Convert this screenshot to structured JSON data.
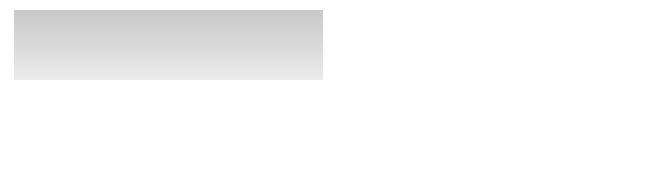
{
  "diagram": {
    "type": "communication-process-model",
    "nodes": [
      {
        "id": "source",
        "label": "Source"
      },
      {
        "id": "message",
        "label": "Message"
      },
      {
        "id": "medium",
        "label": "Medium"
      },
      {
        "id": "receiver",
        "label": "Receiver"
      },
      {
        "id": "feedback",
        "label": "Feedback"
      }
    ],
    "stages": [
      {
        "id": "encoding",
        "label": "Encoding",
        "fill": "#ececec"
      },
      {
        "id": "transmission",
        "label": "Transmission",
        "fill": "#9a9a9a"
      },
      {
        "id": "decoding",
        "label": "Decoding",
        "fill": "#cdcdcd"
      }
    ],
    "noise": {
      "left_label": "NOISE",
      "right_label": "NOISE"
    },
    "edges": [
      {
        "from": "source",
        "to": "message"
      },
      {
        "from": "message",
        "to": "medium"
      },
      {
        "from": "medium",
        "to": "receiver"
      },
      {
        "from": "receiver",
        "to": "feedback"
      },
      {
        "from": "feedback",
        "to": "source",
        "via": "feedback-loop"
      }
    ]
  },
  "colors": {
    "background_panel_top": "#cccccc",
    "background_panel_bottom": "#ececec",
    "line": "#555555",
    "ellipse_fill": "#f0f0f0"
  }
}
